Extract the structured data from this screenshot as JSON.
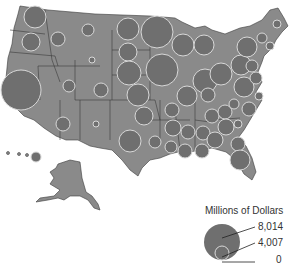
{
  "colors": {
    "land": "#8a8a8a",
    "border": "#3a3a3a",
    "bubble_fill": "#6f6f6f",
    "bubble_stroke": "#d8d8d8",
    "background": "#ffffff",
    "text": "#333333"
  },
  "legend": {
    "title": "Millions of Dollars",
    "values": [
      "8,014",
      "4,007",
      "0"
    ]
  },
  "bubbles": [
    {
      "cx": 35,
      "cy": 17,
      "r": 11
    },
    {
      "cx": 31,
      "cy": 42,
      "r": 9
    },
    {
      "cx": 58,
      "cy": 39,
      "r": 7
    },
    {
      "cx": 21,
      "cy": 90,
      "r": 20
    },
    {
      "cx": 69,
      "cy": 86,
      "r": 6
    },
    {
      "cx": 88,
      "cy": 30,
      "r": 6
    },
    {
      "cx": 92,
      "cy": 60,
      "r": 3
    },
    {
      "cx": 63,
      "cy": 124,
      "r": 7
    },
    {
      "cx": 101,
      "cy": 90,
      "r": 7
    },
    {
      "cx": 96,
      "cy": 124,
      "r": 3
    },
    {
      "cx": 128,
      "cy": 29,
      "r": 11
    },
    {
      "cx": 128,
      "cy": 52,
      "r": 9
    },
    {
      "cx": 129,
      "cy": 73,
      "r": 12
    },
    {
      "cx": 138,
      "cy": 95,
      "r": 11
    },
    {
      "cx": 144,
      "cy": 116,
      "r": 9
    },
    {
      "cx": 157,
      "cy": 32,
      "r": 16
    },
    {
      "cx": 162,
      "cy": 70,
      "r": 16
    },
    {
      "cx": 183,
      "cy": 45,
      "r": 11
    },
    {
      "cx": 204,
      "cy": 45,
      "r": 10
    },
    {
      "cx": 187,
      "cy": 96,
      "r": 10
    },
    {
      "cx": 205,
      "cy": 81,
      "r": 12
    },
    {
      "cx": 221,
      "cy": 74,
      "r": 11
    },
    {
      "cx": 208,
      "cy": 95,
      "r": 7
    },
    {
      "cx": 212,
      "cy": 116,
      "r": 7
    },
    {
      "cx": 172,
      "cy": 110,
      "r": 7
    },
    {
      "cx": 173,
      "cy": 128,
      "r": 8
    },
    {
      "cx": 188,
      "cy": 132,
      "r": 7
    },
    {
      "cx": 203,
      "cy": 133,
      "r": 7
    },
    {
      "cx": 225,
      "cy": 112,
      "r": 7
    },
    {
      "cx": 226,
      "cy": 127,
      "r": 8
    },
    {
      "cx": 234,
      "cy": 104,
      "r": 5
    },
    {
      "cx": 244,
      "cy": 87,
      "r": 10
    },
    {
      "cx": 241,
      "cy": 65,
      "r": 10
    },
    {
      "cx": 252,
      "cy": 66,
      "r": 6
    },
    {
      "cx": 256,
      "cy": 78,
      "r": 6
    },
    {
      "cx": 247,
      "cy": 47,
      "r": 10
    },
    {
      "cx": 262,
      "cy": 38,
      "r": 5
    },
    {
      "cx": 270,
      "cy": 46,
      "r": 4
    },
    {
      "cx": 277,
      "cy": 24,
      "r": 4
    },
    {
      "cx": 259,
      "cy": 96,
      "r": 4
    },
    {
      "cx": 249,
      "cy": 109,
      "r": 7
    },
    {
      "cx": 238,
      "cy": 124,
      "r": 4
    },
    {
      "cx": 238,
      "cy": 144,
      "r": 7
    },
    {
      "cx": 240,
      "cy": 160,
      "r": 10
    },
    {
      "cx": 215,
      "cy": 140,
      "r": 8
    },
    {
      "cx": 202,
      "cy": 151,
      "r": 7
    },
    {
      "cx": 185,
      "cy": 151,
      "r": 7
    },
    {
      "cx": 171,
      "cy": 147,
      "r": 6
    },
    {
      "cx": 155,
      "cy": 142,
      "r": 6
    },
    {
      "cx": 130,
      "cy": 141,
      "r": 11
    },
    {
      "cx": 36,
      "cy": 157,
      "r": 5
    }
  ]
}
